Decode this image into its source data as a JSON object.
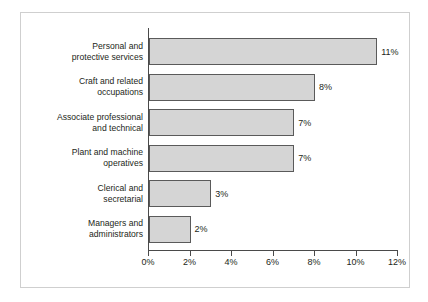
{
  "chart_data": {
    "type": "bar",
    "orientation": "horizontal",
    "title": "",
    "subtitle": "",
    "xlabel": "",
    "ylabel": "",
    "xlim": [
      0,
      12
    ],
    "grid": false,
    "legend": null,
    "value_suffix": "%",
    "categories": [
      "Personal and protective services",
      "Craft and related occupations",
      "Associate professional and technical",
      "Plant and machine operatives",
      "Clerical and secretarial",
      "Managers and administrators"
    ],
    "values": [
      11,
      8,
      7,
      7,
      3,
      2
    ],
    "data_labels": [
      "11%",
      "8%",
      "7%",
      "7%",
      "3%",
      "2%"
    ],
    "xticks": [
      0,
      2,
      4,
      6,
      8,
      10,
      12
    ],
    "xtick_labels": [
      "0%",
      "2%",
      "4%",
      "6%",
      "8%",
      "10%",
      "12%"
    ],
    "colors": {
      "bar_fill": "#d5d5d5",
      "bar_border": "#5a5a5a",
      "axis": "#4a4a4a",
      "text": "#231f20",
      "frame": "#cfcfcf",
      "background": "#ffffff"
    }
  },
  "categories_display": [
    {
      "line1": "Personal and",
      "line2": "protective services"
    },
    {
      "line1": "Craft and related",
      "line2": "occupations"
    },
    {
      "line1": "Associate professional",
      "line2": "and technical"
    },
    {
      "line1": "Plant and machine",
      "line2": "operatives"
    },
    {
      "line1": "Clerical and",
      "line2": "secretarial"
    },
    {
      "line1": "Managers and",
      "line2": "administrators"
    }
  ]
}
